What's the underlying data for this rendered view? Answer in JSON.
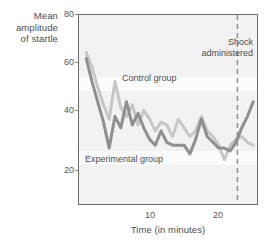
{
  "figure": {
    "background_color": "#ffffff",
    "plot_background_color": "#fbfbfb",
    "frame_color": "#6e6e6e"
  },
  "labels": {
    "y_axis_title_line1": "Mean",
    "y_axis_title_line2": "amplitude",
    "y_axis_title_line3": "of startle",
    "x_axis_title": "Time (in minutes)",
    "annotation_shock_line1": "Shock",
    "annotation_shock_line2": "administered",
    "series_label_control": "Control group",
    "series_label_experimental": "Experimental group"
  },
  "ticks": {
    "y": [
      "80",
      "60",
      "40",
      "20"
    ],
    "x": [
      "10",
      "20"
    ]
  },
  "chart_data": {
    "type": "line",
    "title": "",
    "xlabel": "Time (in minutes)",
    "ylabel": "Mean amplitude of startle",
    "xlim": [
      0,
      25
    ],
    "ylim": [
      14,
      80
    ],
    "yticks": [
      80,
      60,
      40,
      20
    ],
    "xticks": [
      10,
      20
    ],
    "grid": false,
    "legend": "inline-annotations",
    "annotations": [
      {
        "text": "Shock administered",
        "x": 22.0,
        "type": "vertical-dashed-line",
        "color": "#8c8c8c"
      }
    ],
    "series": [
      {
        "name": "Control group",
        "color": "#c6c6c6",
        "x": [
          1,
          1.8,
          2.6,
          3.4,
          4.2,
          5.0,
          5.8,
          6.6,
          7.4,
          8.2,
          9.0,
          9.8,
          10.6,
          11.4,
          12.2,
          13.0,
          13.8,
          14.6,
          15.4,
          16.2,
          17.0,
          17.8,
          18.6,
          19.4,
          20.2,
          21.0,
          21.8,
          22.6,
          23.4,
          24.2
        ],
        "y": [
          67,
          62,
          55,
          49,
          44,
          57,
          48,
          45,
          49,
          42,
          47,
          44,
          40,
          43,
          42,
          38,
          44,
          41,
          38,
          40,
          45,
          40,
          38,
          35,
          30,
          35,
          37,
          38,
          36,
          35
        ]
      },
      {
        "name": "Experimental group",
        "color": "#8f8f8f",
        "x": [
          1,
          1.8,
          2.6,
          3.4,
          4.2,
          5.0,
          5.8,
          6.6,
          7.4,
          8.2,
          9.0,
          9.8,
          10.6,
          11.4,
          12.2,
          13.0,
          13.8,
          14.6,
          15.4,
          16.2,
          17.0,
          17.8,
          18.6,
          19.4,
          20.2,
          21.0,
          21.8,
          22.6,
          23.4,
          24.2
        ],
        "y": [
          65,
          57,
          50,
          43,
          34,
          45,
          41,
          50,
          42,
          46,
          41,
          37,
          35,
          40,
          36,
          35,
          35,
          35,
          32,
          37,
          44,
          38,
          36,
          34,
          34,
          33,
          36,
          41,
          45,
          50
        ]
      }
    ]
  }
}
